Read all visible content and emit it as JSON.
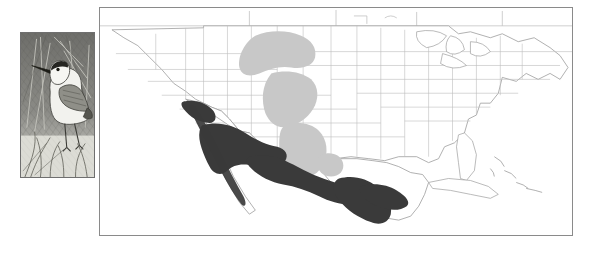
{
  "figure": {
    "kind": "species-range-map",
    "background_color": "#ffffff"
  },
  "illustration": {
    "subject": "shorebird",
    "description": "grayscale pen-and-ink drawing of a standing phalarope-like shorebird among reeds",
    "frame_color": "#6f6f6f",
    "background_color": "#e9e9e6"
  },
  "map": {
    "frame_color": "#8a8a8a",
    "land_outline_color": "#9a9a9a",
    "state_border_color": "#b4b4b4",
    "breeding_color": "#c8c8c8",
    "wintering_color": "#3a3a3a",
    "regions": [
      "United States",
      "southern Canada",
      "Mexico",
      "Cuba",
      "Bahamas"
    ],
    "range_areas": [
      {
        "type": "breeding",
        "label": "northern Rockies / Great Plains"
      },
      {
        "type": "breeding",
        "label": "Wyoming / Colorado basin"
      },
      {
        "type": "breeding",
        "label": "west Texas / New Mexico patch"
      },
      {
        "type": "wintering",
        "label": "Baja California"
      },
      {
        "type": "wintering",
        "label": "northwest Mexico / Sonora"
      },
      {
        "type": "wintering",
        "label": "central and Gulf coast Mexico"
      }
    ]
  },
  "legend": {
    "items": [
      {
        "label": "breeding range",
        "color": "#c8c8c8"
      },
      {
        "label": "wintering range",
        "color": "#3a3a3a"
      }
    ]
  }
}
